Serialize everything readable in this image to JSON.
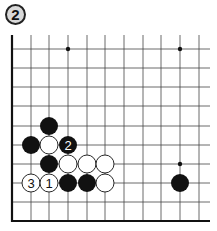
{
  "diagram": {
    "label": "2",
    "board": {
      "origin_x": 12,
      "origin_y": 49,
      "cols_x": [
        12,
        31,
        49,
        68,
        87,
        105,
        124,
        143,
        161,
        180,
        199
      ],
      "rows_y": [
        49,
        68,
        87,
        106,
        126,
        145,
        164,
        183,
        202
      ],
      "top_extent_y": 35,
      "bottom_edge_y": 221,
      "right_extent_x": 210,
      "stone_radius": 9
    },
    "star_points": [
      {
        "col": 3,
        "row": 0
      },
      {
        "col": 9,
        "row": 0
      },
      {
        "col": 9,
        "row": 6
      }
    ],
    "stones": [
      {
        "color": "black",
        "col": 2,
        "row": 4,
        "label": ""
      },
      {
        "color": "black",
        "col": 1,
        "row": 5,
        "label": ""
      },
      {
        "color": "white",
        "col": 2,
        "row": 5,
        "label": ""
      },
      {
        "color": "black",
        "col": 3,
        "row": 5,
        "label": "2"
      },
      {
        "color": "black",
        "col": 2,
        "row": 6,
        "label": ""
      },
      {
        "color": "white",
        "col": 3,
        "row": 6,
        "label": ""
      },
      {
        "color": "white",
        "col": 4,
        "row": 6,
        "label": ""
      },
      {
        "color": "white",
        "col": 5,
        "row": 6,
        "label": ""
      },
      {
        "color": "white",
        "col": 1,
        "row": 7,
        "label": "3"
      },
      {
        "color": "white",
        "col": 2,
        "row": 7,
        "label": "1"
      },
      {
        "color": "black",
        "col": 3,
        "row": 7,
        "label": ""
      },
      {
        "color": "black",
        "col": 4,
        "row": 7,
        "label": ""
      },
      {
        "color": "white",
        "col": 5,
        "row": 7,
        "label": ""
      },
      {
        "color": "black",
        "col": 9,
        "row": 7,
        "label": ""
      }
    ],
    "colors": {
      "grid": "#444444",
      "edge": "#111111",
      "black_stone": "#111111",
      "white_stone": "#ffffff",
      "label_bg": "#d9d9d9"
    }
  }
}
